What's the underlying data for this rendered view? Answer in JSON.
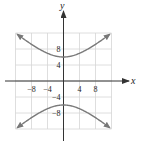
{
  "chart_data": {
    "type": "line",
    "title": "",
    "xlabel": "x",
    "ylabel": "y",
    "equation": "y^2/36 - x^2/48 = 1",
    "xlim": [
      -12,
      12
    ],
    "ylim": [
      -12,
      12
    ],
    "grid": true,
    "grid_step": 4,
    "x_ticks": [
      {
        "value": -8,
        "label": "−8"
      },
      {
        "value": -4,
        "label": "−4"
      },
      {
        "value": 4,
        "label": "4"
      },
      {
        "value": 8,
        "label": "8"
      }
    ],
    "y_ticks": [
      {
        "value": 8,
        "label": "8"
      },
      {
        "value": 4,
        "label": "4"
      },
      {
        "value": -4,
        "label": "−4"
      },
      {
        "value": -8,
        "label": "−8"
      }
    ],
    "series": [
      {
        "name": "upper branch",
        "x": [
          -12,
          -8,
          -4,
          0,
          4,
          8,
          12
        ],
        "y": [
          12,
          9.17,
          6.93,
          6,
          6.93,
          9.17,
          12
        ]
      },
      {
        "name": "lower branch",
        "x": [
          -12,
          -8,
          -4,
          0,
          4,
          8,
          12
        ],
        "y": [
          -12,
          -9.17,
          -6.93,
          -6,
          -6.93,
          -9.17,
          -12
        ]
      }
    ],
    "colors": {
      "curve": "#7a7a7a",
      "grid": "#d6d6d6",
      "axis": "#333333"
    }
  }
}
